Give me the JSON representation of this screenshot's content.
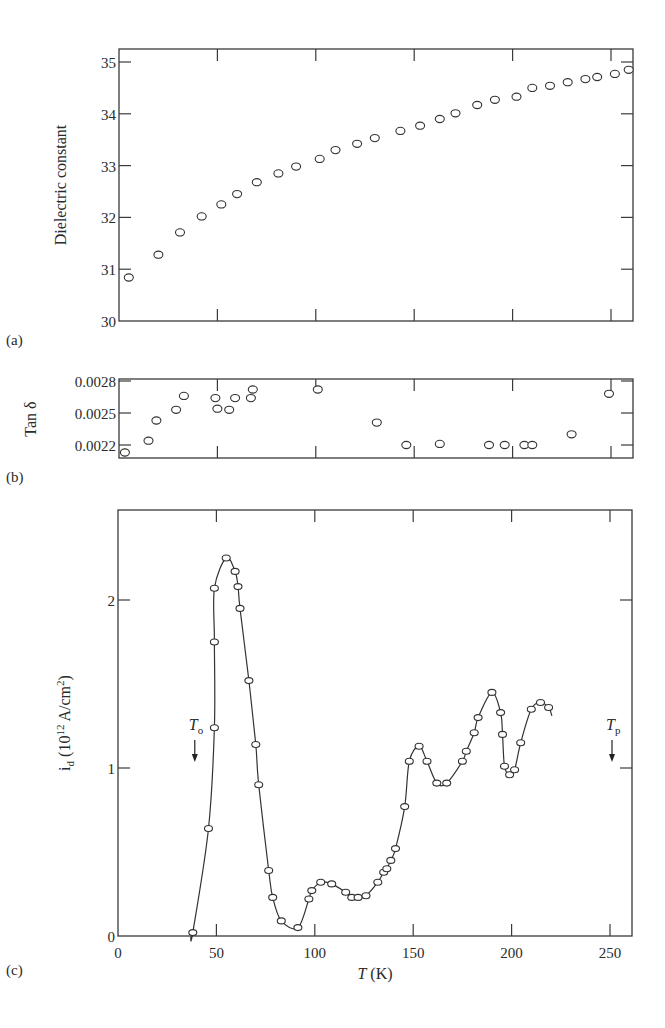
{
  "figure": {
    "panel_labels": [
      "(a)",
      "(b)",
      "(c)"
    ],
    "x_axis_label_italic": "T",
    "x_axis_label_unit": " (K)"
  },
  "chart_data": [
    {
      "panel": "(a)",
      "type": "scatter",
      "title": "",
      "xlabel": "",
      "ylabel": "Dielectric constant",
      "xlim": [
        0,
        261
      ],
      "ylim": [
        30,
        35.25
      ],
      "xticks": [
        0,
        50,
        100,
        150,
        200,
        250
      ],
      "xtick_labels_shown": false,
      "yticks": [
        30,
        31,
        32,
        33,
        34,
        35
      ],
      "ytick_labels": [
        "30",
        "31",
        "32",
        "33",
        "34",
        "35"
      ],
      "grid": false,
      "marker": "open-ellipse",
      "x": [
        5,
        20,
        31,
        42,
        52,
        60,
        70,
        81,
        90,
        102,
        110,
        121,
        130,
        143,
        153,
        163,
        171,
        182,
        191,
        202,
        210,
        219,
        228,
        237,
        243,
        252,
        259
      ],
      "y": [
        30.84,
        31.28,
        31.71,
        32.02,
        32.25,
        32.45,
        32.68,
        32.85,
        32.98,
        33.13,
        33.3,
        33.42,
        33.53,
        33.67,
        33.77,
        33.9,
        34.01,
        34.17,
        34.27,
        34.33,
        34.5,
        34.54,
        34.61,
        34.67,
        34.71,
        34.77,
        34.85
      ]
    },
    {
      "panel": "(b)",
      "type": "scatter",
      "title": "",
      "xlabel": "",
      "ylabel": "Tan δ",
      "xlim": [
        0,
        261
      ],
      "ylim": [
        0.00208,
        0.0028
      ],
      "xticks": [
        0,
        50,
        100,
        150,
        200,
        250
      ],
      "xtick_labels_shown": false,
      "yticks": [
        0.0022,
        0.0025,
        0.0028
      ],
      "ytick_labels": [
        "0.0022",
        "0.0025",
        "0.0028"
      ],
      "grid": false,
      "marker": "open-ellipse",
      "x": [
        3,
        15,
        19,
        29,
        33,
        49,
        50,
        56,
        59,
        67,
        68,
        101,
        131,
        146,
        163,
        188,
        196,
        206,
        210,
        230,
        249
      ],
      "y": [
        0.00213,
        0.00224,
        0.00243,
        0.00253,
        0.00266,
        0.00264,
        0.00254,
        0.00253,
        0.00264,
        0.00264,
        0.00272,
        0.00272,
        0.00241,
        0.0022,
        0.00221,
        0.0022,
        0.0022,
        0.0022,
        0.0022,
        0.0023,
        0.00268
      ]
    },
    {
      "panel": "(c)",
      "type": "line",
      "title": "",
      "xlabel": "T (K)",
      "ylabel": "i_d (10^12 A/cm^2)",
      "ylabel_parts": {
        "main": "i",
        "sub": "d",
        "mid": " (10",
        "sup1": "12",
        "after": " A/cm",
        "sup2": "2",
        "end": ")"
      },
      "xlim": [
        0,
        261
      ],
      "ylim": [
        0,
        2.54
      ],
      "xticks": [
        0,
        50,
        100,
        150,
        200,
        250
      ],
      "xtick_labels": [
        "0",
        "50",
        "100",
        "150",
        "200",
        "250"
      ],
      "yticks": [
        0,
        1,
        2
      ],
      "ytick_labels": [
        "0",
        "1",
        "2"
      ],
      "grid": false,
      "marker": "open-ellipse-with-smooth-curve",
      "x": [
        38,
        46,
        49,
        49,
        49,
        55,
        59.5,
        61,
        62,
        66.5,
        70,
        71.5,
        76.6,
        78.6,
        83,
        91.4,
        97,
        98.5,
        103,
        108.6,
        115.7,
        118.8,
        122,
        126,
        132,
        135,
        136.6,
        138.6,
        141,
        145.7,
        148,
        153,
        157,
        162,
        167,
        175,
        177,
        181,
        183,
        190,
        194.4,
        195.4,
        196.4,
        199,
        201.5,
        204.6,
        210,
        214.7,
        218.8
      ],
      "y": [
        0.02,
        0.64,
        1.24,
        1.75,
        2.07,
        2.25,
        2.17,
        2.08,
        1.95,
        1.52,
        1.14,
        0.9,
        0.39,
        0.23,
        0.09,
        0.05,
        0.22,
        0.27,
        0.32,
        0.31,
        0.26,
        0.23,
        0.23,
        0.24,
        0.32,
        0.38,
        0.4,
        0.45,
        0.52,
        0.77,
        1.04,
        1.13,
        1.04,
        0.91,
        0.91,
        1.04,
        1.1,
        1.21,
        1.3,
        1.45,
        1.33,
        1.2,
        1.01,
        0.96,
        0.99,
        1.15,
        1.35,
        1.39,
        1.36
      ],
      "annotations": [
        {
          "label": "T",
          "sub": "o",
          "x": 38,
          "arrow": "down"
        },
        {
          "label": "T",
          "sub": "p",
          "x": 250,
          "arrow": "down"
        }
      ]
    }
  ]
}
